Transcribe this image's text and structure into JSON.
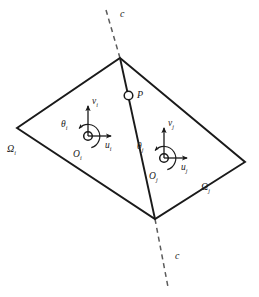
{
  "figure": {
    "background_color": "#ffffff",
    "stroke_color": "#1a1a1a"
  },
  "cut_line": {
    "name": "cut-line",
    "style": "dashed",
    "top_label": "c",
    "bottom_label": "c"
  },
  "point": {
    "label": "P",
    "marker": "open-circle"
  },
  "domains": [
    {
      "id": "i",
      "label": "Ω",
      "subscript": "i"
    },
    {
      "id": "j",
      "label": "Ω",
      "subscript": "j"
    }
  ],
  "frames": [
    {
      "id": "i",
      "origin_label": "O",
      "origin_subscript": "i",
      "x_axis_label": "u",
      "x_axis_subscript": "i",
      "y_axis_label": "v",
      "y_axis_subscript": "i",
      "rotation_label": "θ",
      "rotation_subscript": "i"
    },
    {
      "id": "j",
      "origin_label": "O",
      "origin_subscript": "j",
      "x_axis_label": "u",
      "x_axis_subscript": "j",
      "y_axis_label": "v",
      "y_axis_subscript": "j",
      "rotation_label": "θ",
      "rotation_subscript": "j"
    }
  ],
  "geometry": {
    "quad_vertices_label": "quadrilateral",
    "top_vertex": "120,58",
    "left_vertex": "17,128",
    "right_vertex": "245,162",
    "bottom_vertex": "155,219"
  }
}
